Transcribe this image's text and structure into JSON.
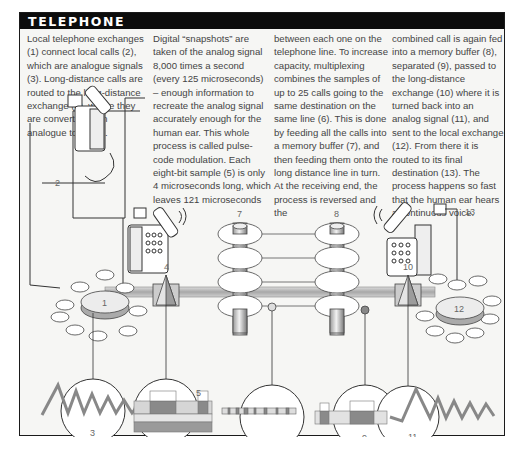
{
  "header": {
    "title": "TELEPHONE"
  },
  "text": {
    "col1": "Local telephone exchanges (1) connect local calls (2), which are analogue signals (3). Long-distance calls are routed to the long-distance exchange (4), where they are converted from analogue to digital.",
    "col2": "Digital “snapshots” are taken of the analog signal 8,000 times a second (every 125 microseconds) – enough information to recreate the analog signal accurately enough for the human ear. This whole process is called pulse-code modulation. Each eight-bit sample (5) is only 4 microseconds long, which leaves 121 microseconds",
    "col3": "between each one on the telephone line. To increase capacity, multiplexing combines the samples of up to 25 calls going to the same destination on the same line (6). This is done by feeding all the calls into a memory buffer (7), and then feeding them onto the long distance line in turn. At the receiving end, the process is reversed and the",
    "col4": "combined call is again fed into a memory buffer (8), separated (9), passed to the long-distance exchange (10) where it is turned back into an analog signal (11), and sent to the local exchange (12). From there it is routed to its final destination (13). The process happens so fast that the human ear hears a continuous voice."
  },
  "diagram": {
    "labels": {
      "local_exchange": "1",
      "local_calls": "2",
      "analogue_signal": "3",
      "long_distance_exchange_a": "4",
      "eight_bit_sample": "5",
      "multiplexed_line": "6",
      "memory_buffer_a": "7",
      "memory_buffer_b": "8",
      "separated": "9",
      "long_distance_exchange_b": "10",
      "analog_signal_out": "11",
      "local_exchange_b": "12",
      "final_destination": "13"
    },
    "colors": {
      "header_bg": "#0c0c0c",
      "header_text": "#ffffff",
      "panel_bg": "#f6f6f4",
      "line": "#333333",
      "trunk": "#b8b8b8",
      "sample_dark": "#8a8a8a",
      "sample_light": "#d6d6d6"
    }
  }
}
